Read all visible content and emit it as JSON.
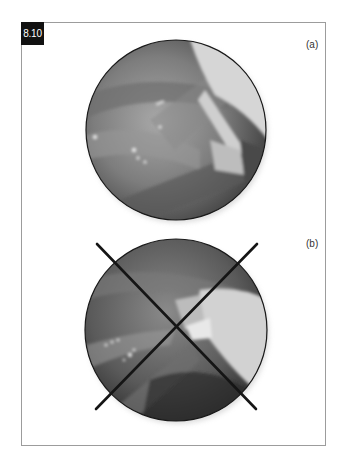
{
  "figure": {
    "number": "8.10",
    "panels": [
      {
        "label": "(a)",
        "description": "circular endoscopic image of surgical field with instrument",
        "crossed_out": false
      },
      {
        "label": "(b)",
        "description": "circular endoscopic image with large X overlay",
        "crossed_out": true
      }
    ]
  },
  "colors": {
    "frame_border": "#9c9c9c",
    "label_bg": "#111111",
    "label_text": "#ffffff",
    "cross_stroke": "#151515"
  }
}
